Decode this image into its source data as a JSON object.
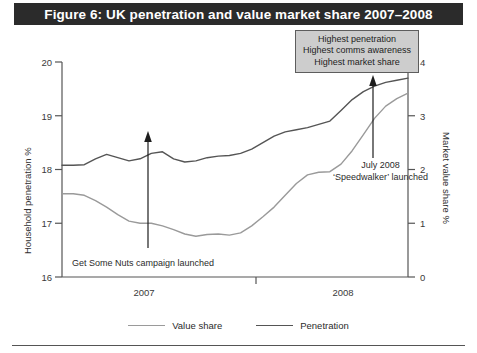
{
  "figure": {
    "title": "Figure 6: UK penetration and value market share 2007–2008",
    "title_bg": "#2b2b2b",
    "title_color": "#ffffff"
  },
  "callout": {
    "lines": [
      "Highest penetration",
      "Highest comms awareness",
      "Highest market share"
    ],
    "bg": "#cdcdcd",
    "border": "#5d5d5d"
  },
  "annotations": {
    "left": "Get Some Nuts campaign launched",
    "right_line1": "July 2008",
    "right_line2": "‘Speedwalker’ launched"
  },
  "legend": {
    "items": [
      {
        "label": "Value share",
        "color": "#9a9a9a"
      },
      {
        "label": "Penetration",
        "color": "#555555"
      }
    ]
  },
  "chart_data": {
    "type": "line",
    "title": "Figure 6: UK penetration and value market share 2007–2008",
    "xlabel": "",
    "x_tick_labels": [
      "2007",
      "2008"
    ],
    "grid": false,
    "legend_position": "bottom",
    "axes": {
      "left": {
        "label": "Household penetration %",
        "ticks": [
          "16",
          "17",
          "18",
          "19",
          "20"
        ],
        "lim": [
          16,
          20
        ],
        "series": "Penetration"
      },
      "right": {
        "label": "Market value share %",
        "ticks": [
          "0",
          "1",
          "2",
          "3",
          "4"
        ],
        "lim": [
          0,
          4
        ],
        "series": "Value share"
      }
    },
    "series": [
      {
        "name": "Penetration",
        "axis": "left",
        "color": "#555555",
        "values": [
          18.08,
          18.08,
          18.09,
          18.2,
          18.28,
          18.22,
          18.16,
          18.2,
          18.3,
          18.33,
          18.2,
          18.14,
          18.16,
          18.22,
          18.25,
          18.26,
          18.3,
          18.38,
          18.5,
          18.62,
          18.7,
          18.74,
          18.78,
          18.84,
          18.9,
          19.1,
          19.3,
          19.45,
          19.55,
          19.62,
          19.66,
          19.7
        ]
      },
      {
        "name": "Value share",
        "axis": "right",
        "color": "#9a9a9a",
        "values": [
          1.55,
          1.55,
          1.52,
          1.42,
          1.3,
          1.16,
          1.04,
          1.0,
          1.0,
          0.95,
          0.88,
          0.8,
          0.76,
          0.79,
          0.8,
          0.78,
          0.82,
          0.95,
          1.12,
          1.3,
          1.52,
          1.74,
          1.9,
          1.95,
          1.96,
          2.1,
          2.35,
          2.65,
          2.95,
          3.18,
          3.32,
          3.42
        ]
      }
    ],
    "annotations": [
      {
        "text": "Get Some Nuts campaign launched",
        "arrow": true,
        "arrow_x_index": 8
      },
      {
        "text": "July 2008 ‘Speedwalker’ launched",
        "arrow": true,
        "arrow_x_index": 28
      },
      {
        "text": "Highest penetration / Highest comms awareness / Highest market share",
        "arrow": true,
        "arrow_x_index": 28
      }
    ]
  }
}
